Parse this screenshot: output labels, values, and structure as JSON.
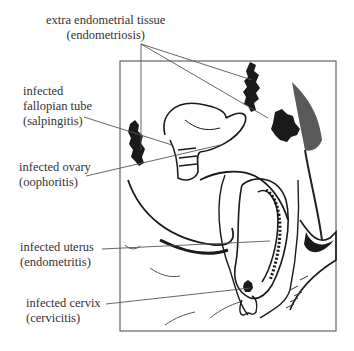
{
  "diagram": {
    "type": "anatomical illustration",
    "line_color": "#555555",
    "ink_color": "#1a1a1a"
  },
  "labels": [
    {
      "id": "endometriosis",
      "line1": "extra endometrial tissue",
      "line2": "(endometriosis)"
    },
    {
      "id": "salpingitis",
      "line1": "infected",
      "line2": "fallopian tube",
      "line3": "(salpingitis)"
    },
    {
      "id": "oophoritis",
      "line1": "infected ovary",
      "line2": "(oophoritis)"
    },
    {
      "id": "endometritis",
      "line1": "infected uterus",
      "line2": "(endometritis)"
    },
    {
      "id": "cervicitis",
      "line1": "infected cervix",
      "line2": "(cervicitis)"
    }
  ]
}
